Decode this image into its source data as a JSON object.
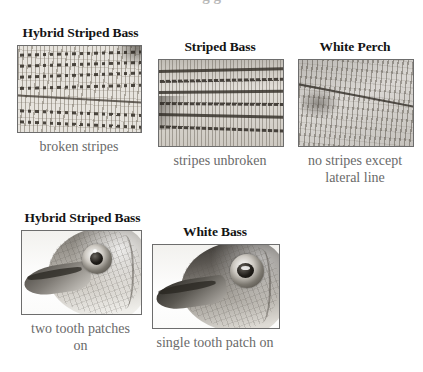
{
  "page": {
    "background_color": "#ffffff",
    "cutoff_top_text": "g g"
  },
  "colors": {
    "heading": "#141414",
    "caption": "#6a6a6a",
    "photo_border": "#6d6d6d",
    "background": "#ffffff"
  },
  "rows": [
    {
      "row_name": "stripe-comparison-row",
      "panels": [
        {
          "id": "hybrid-striped-bass-flank",
          "heading": "Hybrid Striped Bass",
          "caption": "broken stripes",
          "photo_alt": "close-up of fish flank scales with broken dotted stripes"
        },
        {
          "id": "striped-bass-flank",
          "heading": "Striped Bass",
          "caption": "stripes unbroken",
          "photo_alt": "close-up of fish flank scales with continuous unbroken stripes"
        },
        {
          "id": "white-perch-flank",
          "heading": "White Perch",
          "caption": "no stripes except lateral line",
          "photo_alt": "close-up of fish flank scales with no stripes, only a lateral line"
        }
      ]
    },
    {
      "row_name": "tooth-patch-comparison-row",
      "panels": [
        {
          "id": "hybrid-striped-bass-head",
          "heading": "Hybrid Striped Bass",
          "caption": "two tooth patches on",
          "photo_alt": "profile close-up of hybrid striped bass head and eye"
        },
        {
          "id": "white-bass-head",
          "heading": "White Bass",
          "caption": "single tooth patch on",
          "photo_alt": "profile close-up of white bass head and eye"
        }
      ]
    }
  ]
}
